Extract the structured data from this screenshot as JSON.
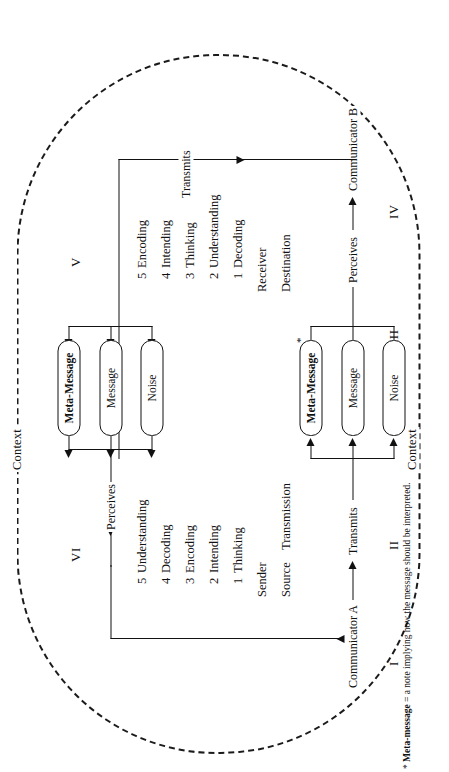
{
  "figure": {
    "context_label_left": "Context",
    "context_label_right": "Context",
    "footnote_marker": "*",
    "footnote_term": "Meta-message",
    "footnote_text": "= a note implying how the message should be interpreted."
  },
  "stages": {
    "i": "I",
    "ii": "II",
    "iii": "III",
    "iv": "IV",
    "v": "V",
    "vi": "VI"
  },
  "actors": {
    "communicator_a": "Communicator A",
    "communicator_b": "Communicator B"
  },
  "flows": {
    "transmits_top": "Transmits",
    "perceives_top": "Perceives",
    "transmits_bottom": "Transmits",
    "perceives_bottom": "Perceives"
  },
  "sender_block": {
    "heading_source": "Source",
    "heading_transmission": "Transmission",
    "role": "Sender",
    "steps": [
      {
        "num": "1",
        "label": "Thinking"
      },
      {
        "num": "2",
        "label": "Intending"
      },
      {
        "num": "3",
        "label": "Encoding"
      },
      {
        "num": "4",
        "label": "Decoding"
      },
      {
        "num": "5",
        "label": "Understanding"
      }
    ]
  },
  "receiver_block": {
    "heading_destination": "Destination",
    "role": "Receiver",
    "steps": [
      {
        "num": "1",
        "label": "Decoding"
      },
      {
        "num": "2",
        "label": "Understanding"
      },
      {
        "num": "3",
        "label": "Thinking"
      },
      {
        "num": "4",
        "label": "Intending"
      },
      {
        "num": "5",
        "label": "Encoding"
      }
    ]
  },
  "channel_top": {
    "meta_message": "Meta-Message",
    "message": "Message",
    "noise": "Noise",
    "asterisk": "*"
  },
  "channel_bottom": {
    "meta_message": "Meta-Message",
    "message": "Message",
    "noise": "Noise"
  },
  "colors": {
    "ink": "#111111",
    "paper": "#ffffff"
  }
}
